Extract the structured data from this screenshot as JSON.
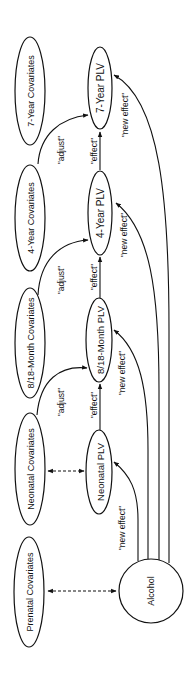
{
  "diagram": {
    "orientation": "rotated-90-ccw",
    "colors": {
      "stroke": "#111111",
      "background": "#ffffff",
      "text": "#111111"
    },
    "nodes": {
      "seven_year_covariates": {
        "label": "7-Year Covariates",
        "shape": "ellipse"
      },
      "seven_year_plv": {
        "label": "7-Year PLV",
        "shape": "ellipse"
      },
      "four_year_covariates": {
        "label": "4-Year Covariates",
        "shape": "ellipse"
      },
      "four_year_plv": {
        "label": "4-Year PLV",
        "shape": "ellipse"
      },
      "month_covariates": {
        "label": "8/18-Month Covariates",
        "shape": "ellipse"
      },
      "month_plv": {
        "label": "8/18-Month PLV",
        "shape": "ellipse"
      },
      "neonatal_covariates": {
        "label": "Neonatal Covariates",
        "shape": "ellipse"
      },
      "neonatal_plv": {
        "label": "Neonatal PLV",
        "shape": "ellipse"
      },
      "prenatal_covariates": {
        "label": "Prenatal Covariates",
        "shape": "ellipse"
      },
      "alcohol": {
        "label": "Alcohol",
        "shape": "circle"
      }
    },
    "edges": {
      "adjust_7yr": {
        "from": "4-Year Covariates",
        "to": "7-Year PLV",
        "label": "\"adjust\"",
        "style": "solid"
      },
      "effect_7yr": {
        "from": "4-Year PLV",
        "to": "7-Year PLV",
        "label": "\"effect\"",
        "style": "solid"
      },
      "new_effect_7yr": {
        "from": "Alcohol",
        "to": "7-Year PLV",
        "label": "\"new effect\"",
        "style": "solid"
      },
      "adjust_4yr": {
        "from": "8/18-Month Covariates",
        "to": "4-Year PLV",
        "label": "\"adjust\"",
        "style": "solid"
      },
      "effect_4yr": {
        "from": "8/18-Month PLV",
        "to": "4-Year PLV",
        "label": "\"effect\"",
        "style": "solid"
      },
      "new_effect_4yr": {
        "from": "Alcohol",
        "to": "4-Year PLV",
        "label": "\"new effect\"",
        "style": "solid"
      },
      "adjust_month": {
        "from": "Neonatal Covariates",
        "to": "8/18-Month PLV",
        "label": "\"adjust\"",
        "style": "solid"
      },
      "effect_month": {
        "from": "Neonatal PLV",
        "to": "8/18-Month PLV",
        "label": "\"effect\"",
        "style": "solid"
      },
      "new_effect_month": {
        "from": "Alcohol",
        "to": "8/18-Month PLV",
        "label": "\"new effect\"",
        "style": "solid"
      },
      "new_effect_neonatal": {
        "from": "Alcohol",
        "to": "Neonatal PLV",
        "label": "\"new effect\"",
        "style": "solid"
      },
      "neonatal_cov_plv": {
        "from": "Neonatal Covariates",
        "to": "Neonatal PLV",
        "label": "",
        "style": "dashed-bidirectional"
      },
      "prenatal_alcohol": {
        "from": "Prenatal Covariates",
        "to": "Alcohol",
        "label": "",
        "style": "dashed-bidirectional"
      }
    }
  }
}
